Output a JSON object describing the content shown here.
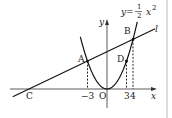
{
  "diagram": {
    "equation": {
      "lhs": "y=",
      "numerator": "1",
      "denominator": "2",
      "rhs": "x",
      "exponent": "2"
    },
    "line_label": "l",
    "axes": {
      "x_label": "x",
      "y_label": "y",
      "origin_label": "O"
    },
    "points": {
      "A": {
        "label": "A",
        "x": -3,
        "y": 4.5
      },
      "B": {
        "label": "B",
        "x": 4,
        "y": 8
      },
      "C": {
        "label": "C",
        "x": -12,
        "y": 0
      },
      "D": {
        "label": "D",
        "x": 3,
        "y": 4.5
      }
    },
    "ticks": [
      {
        "value": -3,
        "label": "−3"
      },
      {
        "value": 3,
        "label": "3"
      },
      {
        "value": 4,
        "label": "4"
      }
    ],
    "parabola_coefficient": 0.5,
    "line": {
      "slope": 0.5,
      "intercept": 6
    }
  }
}
